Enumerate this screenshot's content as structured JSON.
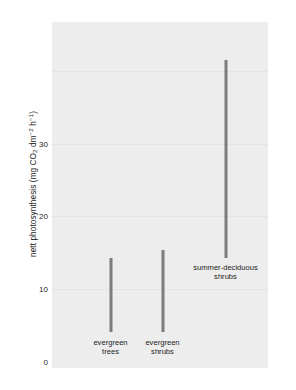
{
  "chart_data": {
    "type": "bar",
    "title": "",
    "xlabel": "",
    "ylabel": "nett photosynthesis (mg CO2 dm-2 h-1)",
    "ylabel_parts": {
      "prefix": "nett photosynthesis (mg CO",
      "sub1": "2",
      "mid": " dm",
      "sup1": "−2",
      "mid2": " h",
      "sup2": "−1",
      "suffix": ")"
    },
    "ylim": [
      0,
      47.5
    ],
    "yticks": [
      0,
      10,
      20,
      30
    ],
    "ytick_labels": [
      "0",
      "10",
      "20",
      "30"
    ],
    "grid": true,
    "legend": "none",
    "categories": [
      "evergreen trees",
      "evergreen shrubs",
      "summer-deciduous shrubs"
    ],
    "series": [
      {
        "name": "range low",
        "values": [
          4.1,
          4.1,
          14.3
        ]
      },
      {
        "name": "range high",
        "values": [
          14.3,
          15.4,
          41.5
        ]
      }
    ],
    "bars": [
      {
        "category": "evergreen trees",
        "label_line1": "evergreen",
        "label_line2": "trees",
        "low": 4.1,
        "high": 14.3,
        "label_position": "below-axis"
      },
      {
        "category": "evergreen shrubs",
        "label_line1": "evergreen",
        "label_line2": "shrubs",
        "low": 4.1,
        "high": 15.4,
        "label_position": "below-axis"
      },
      {
        "category": "summer-deciduous shrubs",
        "label_line1": "summer-deciduous",
        "label_line2": "shrubs",
        "low": 14.3,
        "high": 41.5,
        "label_position": "in-plot"
      }
    ],
    "colors": {
      "bar": "#7d7d7d",
      "panel_background": "#ededed",
      "gridline": "#e3e3e3",
      "text": "#1c1c1c",
      "figure_background": "#ffffff"
    }
  }
}
